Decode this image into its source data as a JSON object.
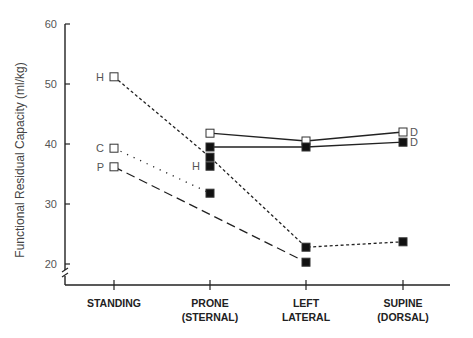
{
  "chart_data": {
    "type": "line",
    "title": "",
    "xlabel": "",
    "ylabel": "Functional Residual Capacity (ml/kg)",
    "ylim": [
      20,
      60
    ],
    "yticks": [
      20,
      30,
      40,
      50,
      60
    ],
    "axis_break": true,
    "grid": false,
    "legend": "none (series labeled inline)",
    "categories": [
      "STANDING",
      "PRONE (STERNAL)",
      "LEFT LATERAL",
      "SUPINE (DORSAL)"
    ],
    "category_lines": [
      [
        "STANDING"
      ],
      [
        "PRONE",
        "(STERNAL)"
      ],
      [
        "LEFT",
        "LATERAL"
      ],
      [
        "SUPINE",
        "(DORSAL)"
      ]
    ],
    "series": [
      {
        "name": "H",
        "style": "short-dash",
        "points": [
          {
            "x": "STANDING",
            "y": 51.2,
            "marker": "open",
            "label": "H"
          },
          {
            "x": "PRONE (STERNAL)",
            "y": 37.8,
            "marker": "filled"
          },
          {
            "x": "LEFT LATERAL",
            "y": 22.8,
            "marker": "filled"
          },
          {
            "x": "SUPINE (DORSAL)",
            "y": 23.7,
            "marker": "filled"
          }
        ]
      },
      {
        "name": "C",
        "style": "dotted",
        "points": [
          {
            "x": "STANDING",
            "y": 39.3,
            "marker": "open",
            "label": "C"
          },
          {
            "x": "PRONE (STERNAL)",
            "y": 31.8,
            "marker": "filled"
          }
        ]
      },
      {
        "name": "P",
        "style": "long-dash",
        "points": [
          {
            "x": "STANDING",
            "y": 36.2,
            "marker": "open",
            "label": "P"
          },
          {
            "x": "LEFT LATERAL",
            "y": 20.3,
            "marker": "filled"
          }
        ]
      },
      {
        "name": "D (open)",
        "style": "solid",
        "points": [
          {
            "x": "PRONE (STERNAL)",
            "y": 41.8,
            "marker": "open"
          },
          {
            "x": "LEFT LATERAL",
            "y": 40.5,
            "marker": "open"
          },
          {
            "x": "SUPINE (DORSAL)",
            "y": 42.0,
            "marker": "open",
            "label": "D"
          }
        ]
      },
      {
        "name": "D (filled)",
        "style": "solid",
        "points": [
          {
            "x": "PRONE (STERNAL)",
            "y": 39.5,
            "marker": "filled"
          },
          {
            "x": "LEFT LATERAL",
            "y": 39.5,
            "marker": "filled"
          },
          {
            "x": "SUPINE (DORSAL)",
            "y": 40.3,
            "marker": "filled",
            "label": "D"
          }
        ]
      },
      {
        "name": "H (prone filled)",
        "style": "none",
        "points": [
          {
            "x": "PRONE (STERNAL)",
            "y": 36.3,
            "marker": "filled",
            "label": "H"
          }
        ]
      }
    ]
  }
}
